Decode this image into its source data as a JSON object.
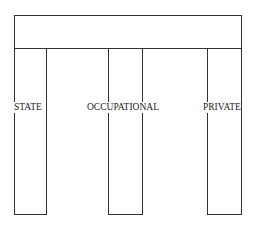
{
  "diagram": {
    "type": "pillars-supporting-beam",
    "beam": {
      "label": ""
    },
    "pillars": [
      {
        "label": "STATE"
      },
      {
        "label": "OCCUPATIONAL"
      },
      {
        "label": "PRIVATE"
      }
    ],
    "colors": {
      "stroke": "#333333",
      "background": "#ffffff"
    }
  }
}
